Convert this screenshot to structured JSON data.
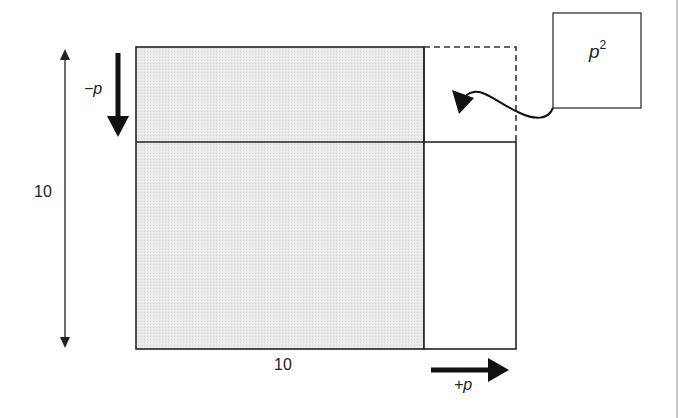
{
  "diagram": {
    "labels": {
      "height_dimension": "10",
      "width_dimension": "10",
      "decrease": "−p",
      "increase": "+p",
      "corner_box_base": "p",
      "corner_box_exp": "2"
    },
    "colors": {
      "shaded_fill": "#e6e6e6",
      "stroke": "#222222",
      "dashed_stroke": "#333333",
      "frame_line": "#b5b5b5"
    }
  }
}
